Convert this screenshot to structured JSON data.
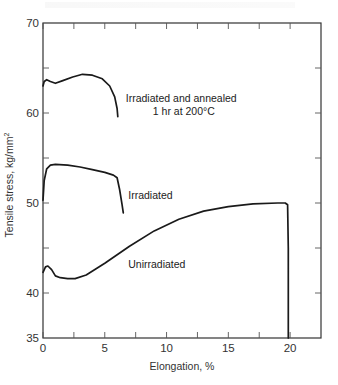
{
  "chart_data": {
    "type": "line",
    "title": "",
    "xlabel": "Elongation, %",
    "ylabel": "Tensile stress, kg/mm",
    "ylabel_superscript": "2",
    "xlim": [
      0,
      22.5
    ],
    "ylim": [
      35,
      70
    ],
    "x_ticks": [
      0,
      5,
      10,
      15,
      20
    ],
    "x_minor_ticks": [
      2.5,
      7.5,
      12.5,
      17.5
    ],
    "y_ticks": [
      35,
      40,
      50,
      60,
      70
    ],
    "y_minor_ticks": [
      45,
      55,
      65
    ],
    "grid": false,
    "legend": "inline annotations",
    "series": [
      {
        "name": "Irradiated and annealed 1 hr at 200°C",
        "x": [
          0.0,
          0.1,
          0.3,
          0.6,
          1.0,
          1.6,
          2.4,
          3.2,
          4.0,
          4.8,
          5.4,
          5.8,
          6.0,
          6.05
        ],
        "y": [
          63.0,
          63.5,
          63.7,
          63.5,
          63.3,
          63.6,
          64.0,
          64.3,
          64.2,
          63.8,
          63.0,
          61.8,
          60.5,
          59.6
        ]
      },
      {
        "name": "Irradiated",
        "x": [
          0.0,
          0.1,
          0.3,
          0.6,
          1.0,
          2.0,
          3.0,
          4.0,
          5.0,
          5.7,
          6.0,
          6.2,
          6.4,
          6.5
        ],
        "y": [
          50.3,
          52.5,
          53.8,
          54.2,
          54.3,
          54.2,
          54.0,
          53.7,
          53.4,
          53.1,
          52.8,
          51.5,
          49.8,
          48.9
        ]
      },
      {
        "name": "Unirradiated",
        "x": [
          0.0,
          0.2,
          0.4,
          0.7,
          1.0,
          1.4,
          2.0,
          2.6,
          3.5,
          5.0,
          7.0,
          9.0,
          11.0,
          13.0,
          15.0,
          17.0,
          19.0,
          19.6,
          19.8,
          19.85,
          19.85
        ],
        "y": [
          42.3,
          42.9,
          43.0,
          42.6,
          41.9,
          41.7,
          41.6,
          41.6,
          42.0,
          43.3,
          45.2,
          46.9,
          48.2,
          49.1,
          49.6,
          49.9,
          50.0,
          50.0,
          49.8,
          45.0,
          35.0
        ]
      }
    ],
    "annotations": [
      {
        "text_line1": "Irradiated and annealed",
        "text_line2": "1 hr at 200°C",
        "x": 6.7,
        "y": 61.2
      },
      {
        "text": "Irradiated",
        "x": 6.9,
        "y": 50.4
      },
      {
        "text": "Unirradiated",
        "x": 6.9,
        "y": 42.8
      }
    ]
  },
  "labels": {
    "xlabel": "Elongation, %",
    "ylabel": "Tensile stress, kg/mm",
    "ylabel_sup": "2",
    "annot_annealed_1": "Irradiated and annealed",
    "annot_annealed_2": "1 hr at 200°C",
    "annot_irradiated": "Irradiated",
    "annot_unirradiated": "Unirradiated"
  }
}
